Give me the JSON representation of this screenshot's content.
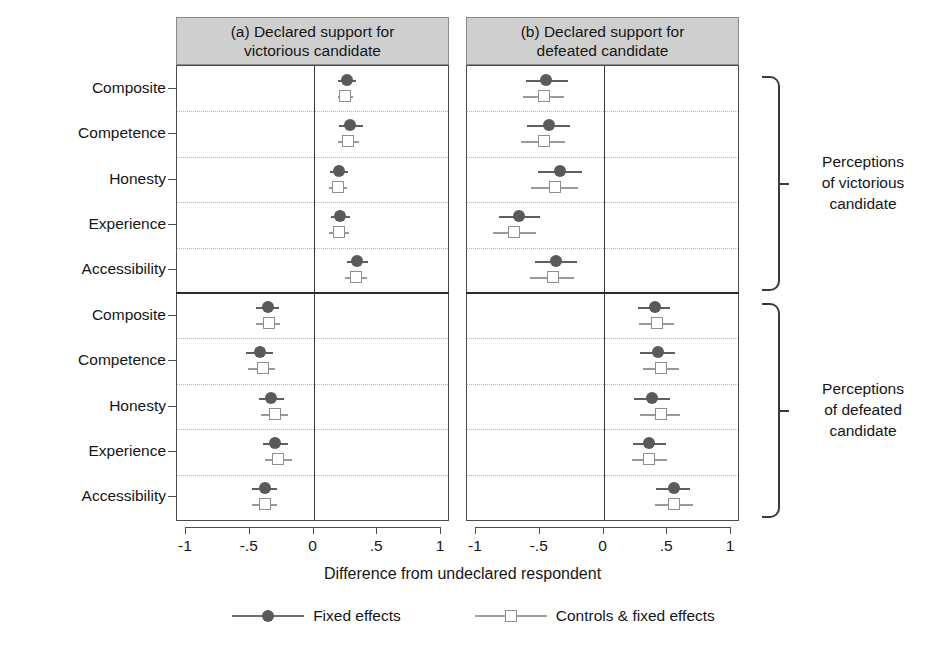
{
  "figure": {
    "axis_title": "Difference from undeclared respondent",
    "panels": [
      {
        "id": "a",
        "title_line1": "(a) Declared support for",
        "title_line2": "victorious candidate"
      },
      {
        "id": "b",
        "title_line1": "(b) Declared support for",
        "title_line2": "defeated candidate"
      }
    ],
    "block_labels": [
      {
        "line1": "Perceptions",
        "line2": "of victorious",
        "line3": "candidate"
      },
      {
        "line1": "Perceptions",
        "line2": "of defeated",
        "line3": "candidate"
      }
    ],
    "legend": [
      {
        "label": "Fixed effects",
        "marker": "filled-circle"
      },
      {
        "label": "Controls & fixed effects",
        "marker": "open-square"
      }
    ],
    "colors": {
      "fixed_effects": "#5a5a5a",
      "controls_fixed_effects": "#8f8f8f",
      "panel_header_bg": "#cfcfcf",
      "frame": "#4d4d4d",
      "gridline": "#b9b9b9"
    }
  },
  "chart_data": {
    "type": "scatter",
    "title": "",
    "xlabel": "Difference from undeclared respondent",
    "ylabel": "",
    "xlim": [
      -1,
      1
    ],
    "xticks": [
      -1,
      -0.5,
      0,
      0.5,
      1
    ],
    "xticklabels": [
      "-1",
      "-.5",
      "0",
      ".5",
      "1"
    ],
    "grid": true,
    "legend_position": "bottom",
    "categories": [
      "Composite",
      "Competence",
      "Honesty",
      "Experience",
      "Accessibility"
    ],
    "blocks": [
      {
        "name": "Perceptions of victorious candidate",
        "panels": [
          {
            "panel": "a",
            "series": [
              {
                "name": "Fixed effects",
                "points": [
                  {
                    "category": "Composite",
                    "estimate": 0.26,
                    "ci_low": 0.19,
                    "ci_high": 0.33
                  },
                  {
                    "category": "Competence",
                    "estimate": 0.29,
                    "ci_low": 0.2,
                    "ci_high": 0.39
                  },
                  {
                    "category": "Honesty",
                    "estimate": 0.2,
                    "ci_low": 0.13,
                    "ci_high": 0.27
                  },
                  {
                    "category": "Experience",
                    "estimate": 0.21,
                    "ci_low": 0.14,
                    "ci_high": 0.29
                  },
                  {
                    "category": "Accessibility",
                    "estimate": 0.34,
                    "ci_low": 0.26,
                    "ci_high": 0.43
                  }
                ]
              },
              {
                "name": "Controls & fixed effects",
                "points": [
                  {
                    "category": "Composite",
                    "estimate": 0.25,
                    "ci_low": 0.19,
                    "ci_high": 0.31
                  },
                  {
                    "category": "Competence",
                    "estimate": 0.27,
                    "ci_low": 0.19,
                    "ci_high": 0.36
                  },
                  {
                    "category": "Honesty",
                    "estimate": 0.19,
                    "ci_low": 0.12,
                    "ci_high": 0.26
                  },
                  {
                    "category": "Experience",
                    "estimate": 0.2,
                    "ci_low": 0.12,
                    "ci_high": 0.28
                  },
                  {
                    "category": "Accessibility",
                    "estimate": 0.33,
                    "ci_low": 0.25,
                    "ci_high": 0.42
                  }
                ]
              }
            ]
          },
          {
            "panel": "b",
            "series": [
              {
                "name": "Fixed effects",
                "points": [
                  {
                    "category": "Composite",
                    "estimate": -0.45,
                    "ci_low": -0.61,
                    "ci_high": -0.28
                  },
                  {
                    "category": "Competence",
                    "estimate": -0.43,
                    "ci_low": -0.6,
                    "ci_high": -0.26
                  },
                  {
                    "category": "Honesty",
                    "estimate": -0.34,
                    "ci_low": -0.51,
                    "ci_high": -0.17
                  },
                  {
                    "category": "Experience",
                    "estimate": -0.66,
                    "ci_low": -0.82,
                    "ci_high": -0.5
                  },
                  {
                    "category": "Accessibility",
                    "estimate": -0.37,
                    "ci_low": -0.54,
                    "ci_high": -0.21
                  }
                ]
              },
              {
                "name": "Controls & fixed effects",
                "points": [
                  {
                    "category": "Composite",
                    "estimate": -0.47,
                    "ci_low": -0.63,
                    "ci_high": -0.31
                  },
                  {
                    "category": "Competence",
                    "estimate": -0.47,
                    "ci_low": -0.65,
                    "ci_high": -0.3
                  },
                  {
                    "category": "Honesty",
                    "estimate": -0.38,
                    "ci_low": -0.57,
                    "ci_high": -0.2
                  },
                  {
                    "category": "Experience",
                    "estimate": -0.7,
                    "ci_low": -0.87,
                    "ci_high": -0.53
                  },
                  {
                    "category": "Accessibility",
                    "estimate": -0.4,
                    "ci_low": -0.58,
                    "ci_high": -0.23
                  }
                ]
              }
            ]
          }
        ]
      },
      {
        "name": "Perceptions of defeated candidate",
        "panels": [
          {
            "panel": "a",
            "series": [
              {
                "name": "Fixed effects",
                "points": [
                  {
                    "category": "Composite",
                    "estimate": -0.36,
                    "ci_low": -0.45,
                    "ci_high": -0.27
                  },
                  {
                    "category": "Competence",
                    "estimate": -0.42,
                    "ci_low": -0.53,
                    "ci_high": -0.32
                  },
                  {
                    "category": "Honesty",
                    "estimate": -0.33,
                    "ci_low": -0.43,
                    "ci_high": -0.23
                  },
                  {
                    "category": "Experience",
                    "estimate": -0.3,
                    "ci_low": -0.4,
                    "ci_high": -0.2
                  },
                  {
                    "category": "Accessibility",
                    "estimate": -0.38,
                    "ci_low": -0.48,
                    "ci_high": -0.29
                  }
                ]
              },
              {
                "name": "Controls & fixed effects",
                "points": [
                  {
                    "category": "Composite",
                    "estimate": -0.35,
                    "ci_low": -0.45,
                    "ci_high": -0.26
                  },
                  {
                    "category": "Competence",
                    "estimate": -0.4,
                    "ci_low": -0.51,
                    "ci_high": -0.3
                  },
                  {
                    "category": "Honesty",
                    "estimate": -0.3,
                    "ci_low": -0.41,
                    "ci_high": -0.2
                  },
                  {
                    "category": "Experience",
                    "estimate": -0.28,
                    "ci_low": -0.38,
                    "ci_high": -0.17
                  },
                  {
                    "category": "Accessibility",
                    "estimate": -0.38,
                    "ci_low": -0.48,
                    "ci_high": -0.29
                  }
                ]
              }
            ]
          },
          {
            "panel": "b",
            "series": [
              {
                "name": "Fixed effects",
                "points": [
                  {
                    "category": "Composite",
                    "estimate": 0.4,
                    "ci_low": 0.27,
                    "ci_high": 0.52
                  },
                  {
                    "category": "Competence",
                    "estimate": 0.43,
                    "ci_low": 0.29,
                    "ci_high": 0.56
                  },
                  {
                    "category": "Honesty",
                    "estimate": 0.38,
                    "ci_low": 0.24,
                    "ci_high": 0.52
                  },
                  {
                    "category": "Experience",
                    "estimate": 0.36,
                    "ci_low": 0.23,
                    "ci_high": 0.49
                  },
                  {
                    "category": "Accessibility",
                    "estimate": 0.55,
                    "ci_low": 0.41,
                    "ci_high": 0.68
                  }
                ]
              },
              {
                "name": "Controls & fixed effects",
                "points": [
                  {
                    "category": "Composite",
                    "estimate": 0.42,
                    "ci_low": 0.28,
                    "ci_high": 0.55
                  },
                  {
                    "category": "Competence",
                    "estimate": 0.45,
                    "ci_low": 0.31,
                    "ci_high": 0.59
                  },
                  {
                    "category": "Honesty",
                    "estimate": 0.45,
                    "ci_low": 0.29,
                    "ci_high": 0.6
                  },
                  {
                    "category": "Experience",
                    "estimate": 0.36,
                    "ci_low": 0.22,
                    "ci_high": 0.5
                  },
                  {
                    "category": "Accessibility",
                    "estimate": 0.55,
                    "ci_low": 0.4,
                    "ci_high": 0.7
                  }
                ]
              }
            ]
          }
        ]
      }
    ]
  }
}
